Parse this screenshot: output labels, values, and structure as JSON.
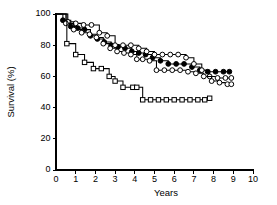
{
  "chart_data": {
    "type": "line",
    "title": "",
    "subtitle": "",
    "xlabel": "Years",
    "ylabel": "Survival (%)",
    "xlim": [
      0,
      10
    ],
    "ylim": [
      0,
      100
    ],
    "xticks": [
      0,
      1,
      2,
      3,
      4,
      5,
      6,
      7,
      8,
      9,
      10
    ],
    "xtick_labels": [
      "0",
      "1",
      "2",
      "3",
      "4",
      "5",
      "6",
      "7",
      "8",
      "9",
      "10"
    ],
    "yticks": [
      0,
      20,
      40,
      60,
      80,
      100
    ],
    "ytick_labels": [
      "0",
      "20",
      "40",
      "60",
      "80",
      "100"
    ],
    "grid": false,
    "legend": null,
    "legend_position": "none",
    "step_style": "post",
    "annotations": [],
    "series": [
      {
        "name": "Series 1 (filled circles)",
        "marker": "circle-filled",
        "marker_fill": "#000000",
        "marker_stroke": "#000000",
        "line_color": "#000000",
        "x": [
          0.0,
          0.35,
          0.75,
          1.1,
          1.45,
          1.75,
          2.1,
          2.45,
          2.8,
          3.15,
          3.5,
          3.85,
          4.2,
          4.55,
          4.9,
          5.3,
          5.7,
          6.1,
          6.5,
          6.9,
          7.3,
          7.7,
          8.1,
          8.5,
          8.8
        ],
        "y": [
          100,
          96,
          92,
          91,
          90,
          86,
          84,
          82,
          80,
          79,
          78,
          76,
          75,
          74,
          72,
          70,
          68,
          68,
          68,
          66,
          64,
          63,
          63,
          63,
          63
        ]
      },
      {
        "name": "Series 2 (open circles, upper)",
        "marker": "circle-open",
        "marker_fill": "#ffffff",
        "marker_stroke": "#000000",
        "line_color": "#000000",
        "x": [
          0.0,
          0.6,
          1.0,
          1.4,
          1.8,
          2.2,
          2.6,
          3.0,
          3.4,
          3.8,
          4.2,
          4.6,
          5.0,
          5.4,
          5.8,
          6.2,
          6.6,
          7.0,
          7.4,
          7.8,
          8.2,
          8.6,
          8.9
        ],
        "y": [
          100,
          95,
          94,
          93,
          93,
          88,
          86,
          80,
          80,
          80,
          78,
          76,
          74,
          74,
          74,
          74,
          72,
          68,
          64,
          60,
          59,
          59,
          59
        ]
      },
      {
        "name": "Series 3 (open circles, middle)",
        "marker": "circle-open",
        "marker_fill": "#ffffff",
        "marker_stroke": "#000000",
        "line_color": "#000000",
        "x": [
          0.0,
          0.5,
          0.9,
          1.3,
          1.7,
          2.05,
          2.4,
          2.75,
          3.1,
          3.45,
          3.8,
          4.1,
          4.4,
          4.75,
          5.1,
          5.5,
          5.9,
          6.3,
          6.7,
          7.1,
          7.5,
          7.9,
          8.3,
          8.7,
          8.9
        ],
        "y": [
          100,
          94,
          90,
          88,
          87,
          85,
          81,
          78,
          76,
          75,
          74,
          71,
          71,
          70,
          64,
          64,
          64,
          64,
          63,
          62,
          60,
          57,
          56,
          55,
          55
        ]
      },
      {
        "name": "Series 4 (open squares)",
        "marker": "square-open",
        "marker_fill": "#ffffff",
        "marker_stroke": "#000000",
        "line_color": "#000000",
        "x": [
          0.0,
          0.55,
          1.0,
          1.45,
          1.9,
          2.3,
          2.7,
          3.0,
          3.4,
          3.9,
          4.1,
          4.4,
          4.8,
          5.2,
          5.6,
          6.0,
          6.4,
          6.8,
          7.2,
          7.55,
          7.8
        ],
        "y": [
          100,
          81,
          74,
          69,
          65,
          65,
          60,
          57,
          53,
          53,
          53,
          45,
          45,
          45,
          45,
          45,
          45,
          45,
          45,
          45,
          46
        ]
      }
    ]
  }
}
